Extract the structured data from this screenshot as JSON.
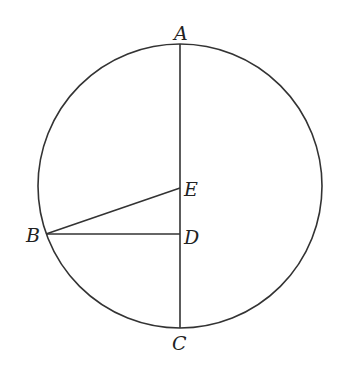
{
  "diagram": {
    "type": "geometry",
    "stroke_color": "#333333",
    "circle": {
      "cx": 180,
      "cy": 186,
      "r": 142
    },
    "points": {
      "A": {
        "label": "A",
        "x": 180,
        "y": 44
      },
      "B": {
        "label": "B",
        "x": 46,
        "y": 234
      },
      "C": {
        "label": "C",
        "x": 180,
        "y": 328
      },
      "D": {
        "label": "D",
        "x": 180,
        "y": 234
      },
      "E": {
        "label": "E",
        "x": 180,
        "y": 188
      }
    },
    "segments": [
      "AC",
      "BD",
      "BE"
    ]
  }
}
